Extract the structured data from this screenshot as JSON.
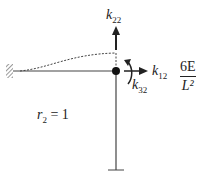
{
  "diagram": {
    "labels": {
      "k22": {
        "base": "k",
        "sub": "22"
      },
      "k12": {
        "base": "k",
        "sub": "12"
      },
      "k32": {
        "base": "k",
        "sub": "32"
      },
      "r2": {
        "base": "r",
        "sub": "2",
        "rest": " = 1"
      },
      "fraction": {
        "numerator": "6E",
        "denominator": "L²"
      }
    },
    "colors": {
      "line": "#444444",
      "arrow": "#222222",
      "joint": "#111111"
    }
  }
}
